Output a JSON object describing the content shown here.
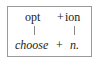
{
  "diagram": {
    "top_row": {
      "part1": "opt",
      "plus": "+",
      "part2": "ion"
    },
    "bottom_row": {
      "gloss1": "choose",
      "plus": "+",
      "gloss2": "n."
    },
    "colors": {
      "text": "#222222",
      "border": "#9a9a9a",
      "connector": "#8a8a8a"
    }
  }
}
